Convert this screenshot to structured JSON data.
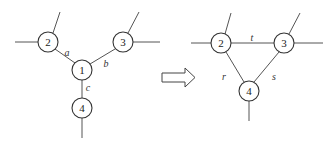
{
  "diagram": {
    "type": "star-mesh transformation",
    "left": {
      "nodes": [
        {
          "id": "1",
          "label": "1",
          "x": 82,
          "y": 70
        },
        {
          "id": "2",
          "label": "2",
          "x": 48,
          "y": 42
        },
        {
          "id": "3",
          "label": "3",
          "x": 123,
          "y": 42
        },
        {
          "id": "4",
          "label": "4",
          "x": 82,
          "y": 108
        }
      ],
      "edges": [
        {
          "from": "2",
          "to": "1",
          "label": "a",
          "lx": 67,
          "ly": 52
        },
        {
          "from": "3",
          "to": "1",
          "label": "b",
          "lx": 106,
          "ly": 63
        },
        {
          "from": "1",
          "to": "4",
          "label": "c",
          "lx": 88,
          "ly": 87
        }
      ]
    },
    "arrow": {
      "symbol": "⇒",
      "direction": "right"
    },
    "right": {
      "nodes": [
        {
          "id": "2",
          "label": "2",
          "x": 221,
          "y": 43
        },
        {
          "id": "3",
          "label": "3",
          "x": 284,
          "y": 43
        },
        {
          "id": "4",
          "label": "4",
          "x": 249,
          "y": 91
        }
      ],
      "edges": [
        {
          "from": "2",
          "to": "3",
          "label": "t",
          "lx": 252,
          "ly": 37
        },
        {
          "from": "2",
          "to": "4",
          "label": "r",
          "lx": 224,
          "ly": 76
        },
        {
          "from": "3",
          "to": "4",
          "label": "s",
          "lx": 274,
          "ly": 76
        }
      ]
    }
  }
}
